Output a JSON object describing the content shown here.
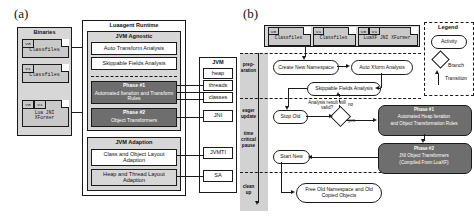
{
  "figure": {
    "panel_a_letter": "(a)",
    "panel_b_letter": "(b)"
  },
  "panel_a": {
    "binaries": {
      "title": "Binaries",
      "documents": [
        {
          "tags": [
            "V0"
          ],
          "label": "Classfiles"
        },
        {
          "tags": [
            "V1"
          ],
          "label": "Classfiles"
        },
        {
          "tags": [
            "V0",
            "V1"
          ],
          "label": "Lua JNI XFormer"
        }
      ]
    },
    "runtime": {
      "title": "Luaagent Runtime",
      "jvm_agnostic": {
        "title": "JVM Agnostic",
        "items": [
          "Auto Transform Analysis",
          "Skippable Fields Analysis"
        ],
        "phases": [
          {
            "title": "Phase #1",
            "subtitle": "Automated Iteration and Transform Rules"
          },
          {
            "title": "Phase #2",
            "subtitle": "Object Transformers"
          }
        ]
      },
      "jvm_adaption": {
        "title": "JVM Adaption",
        "items": [
          "Class and Object Layout Adaption",
          "Heap and Thread Layout Adaption"
        ]
      }
    },
    "jvm": {
      "title": "JVM",
      "items": [
        "heap",
        "threads",
        "classes",
        "JNI",
        "JVMTI",
        "SA"
      ]
    }
  },
  "panel_b": {
    "inputs": [
      {
        "tags": [
          "V0"
        ],
        "label": "Classfiles"
      },
      {
        "tags": [
          "V1"
        ],
        "label": "Classfiles"
      },
      {
        "tags": [
          "V0",
          "V1"
        ],
        "label": "LuaXF JNI XFormer"
      }
    ],
    "phases_labels": [
      "prep-",
      "aration",
      "eager",
      "update",
      "time",
      "critical",
      "pause",
      "clean",
      "up"
    ],
    "activities": {
      "create_namespace": "Create New Namespace",
      "auto_xform": "Auto Xform Analysis",
      "skippable": "Skippable Fields Analysis",
      "stop_old": "Stop Old",
      "start_new": "Start New",
      "free_old": "Free Old Namespace and Old Copied Objects"
    },
    "branch": {
      "question": "Analysis result still valid?",
      "no_label": "no",
      "yes_label": "yes"
    },
    "phase1": {
      "title": "Phase #1",
      "line2": "Automated Heap Iteration",
      "line3": "and Object Transformation Rules"
    },
    "phase2": {
      "title": "Phase #2",
      "line2": "JNI Object Transformers",
      "line3": "(Compiled From LuaXF)"
    },
    "legend": {
      "title": "Legend",
      "activity": "Activity",
      "branch": "Branch",
      "transition": "Transition"
    }
  },
  "colors": {
    "dark_fill": "#6e6e6e",
    "gray_fill": "#c9c9c9",
    "light_fill": "#d7d7d7",
    "stroke": "#1a1a1a"
  }
}
